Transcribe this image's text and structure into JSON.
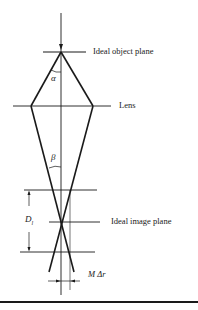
{
  "diagram": {
    "type": "optical-ray-diagram",
    "labels": {
      "object_plane": "Ideal object plane",
      "lens": "Lens",
      "image_plane": "Ideal image plane",
      "alpha": "α",
      "beta": "β",
      "depth_of_focus_main": "D",
      "depth_of_focus_sub": "l",
      "blur": "M Δr"
    },
    "colors": {
      "line": "#1a1a1a",
      "background": "#ffffff"
    }
  }
}
